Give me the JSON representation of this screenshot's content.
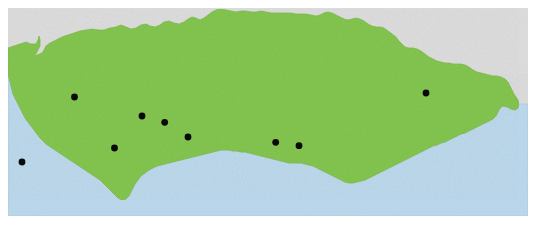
{
  "figure": {
    "kind": "reference-map",
    "width": 537,
    "height": 230
  },
  "colors": {
    "land": "#7DC242",
    "land_shade": "#76BA3E",
    "sea": "#B9D7EC",
    "neighbour_land": "#DCDCDC",
    "outline": "#9FBF7F",
    "sea_outline": "#A9C8DE",
    "point": "#0A0A0A",
    "page": "#FFFFFF"
  },
  "frame": {
    "left": 8,
    "top": 8,
    "right": 528,
    "bottom": 216
  },
  "legend": {
    "land_label": "Land",
    "sea_label": "Sea",
    "neighbour_label": "Adjacent territory",
    "point_label": "Record locality"
  },
  "map_data": {
    "type": "point-map",
    "region_name": "Andalusia",
    "point_radius": 3.4,
    "point_count": 9,
    "points": [
      {
        "id": "p1",
        "x": 22,
        "y": 162,
        "label": ""
      },
      {
        "id": "p2",
        "x": 74.5,
        "y": 97,
        "label": ""
      },
      {
        "id": "p3",
        "x": 114.5,
        "y": 148,
        "label": ""
      },
      {
        "id": "p4",
        "x": 142,
        "y": 116,
        "label": ""
      },
      {
        "id": "p5",
        "x": 164.7,
        "y": 122.3,
        "label": ""
      },
      {
        "id": "p6",
        "x": 188,
        "y": 137,
        "label": ""
      },
      {
        "id": "p7",
        "x": 275.7,
        "y": 142.3,
        "label": ""
      },
      {
        "id": "p8",
        "x": 299,
        "y": 145.7,
        "label": ""
      },
      {
        "id": "p9",
        "x": 426,
        "y": 93,
        "label": ""
      }
    ],
    "land_outline": [
      [
        8,
        48
      ],
      [
        14,
        46
      ],
      [
        20,
        44
      ],
      [
        26,
        42
      ],
      [
        31,
        44
      ],
      [
        36,
        44
      ],
      [
        38,
        40
      ],
      [
        39,
        36
      ],
      [
        40,
        40
      ],
      [
        40,
        46
      ],
      [
        38,
        50
      ],
      [
        36,
        54
      ],
      [
        33,
        56
      ],
      [
        37,
        55
      ],
      [
        42,
        53
      ],
      [
        44,
        50
      ],
      [
        46,
        46
      ],
      [
        50,
        43
      ],
      [
        56,
        40
      ],
      [
        62,
        37
      ],
      [
        68,
        35
      ],
      [
        74,
        33
      ],
      [
        80,
        31
      ],
      [
        86,
        30
      ],
      [
        92,
        29
      ],
      [
        98,
        30
      ],
      [
        104,
        30
      ],
      [
        110,
        28
      ],
      [
        116,
        27
      ],
      [
        121,
        25
      ],
      [
        126,
        27
      ],
      [
        131,
        29
      ],
      [
        136,
        28
      ],
      [
        141,
        25
      ],
      [
        146,
        24
      ],
      [
        150,
        26
      ],
      [
        155,
        27
      ],
      [
        160,
        25
      ],
      [
        164,
        22
      ],
      [
        169,
        21
      ],
      [
        174,
        23
      ],
      [
        179,
        24
      ],
      [
        184,
        22
      ],
      [
        188,
        19
      ],
      [
        192,
        17
      ],
      [
        196,
        18
      ],
      [
        200,
        20
      ],
      [
        204,
        18
      ],
      [
        208,
        15
      ],
      [
        212,
        12
      ],
      [
        216,
        10
      ],
      [
        221,
        9
      ],
      [
        226,
        10
      ],
      [
        231,
        11
      ],
      [
        236,
        12
      ],
      [
        241,
        11
      ],
      [
        246,
        11
      ],
      [
        251,
        12
      ],
      [
        256,
        12
      ],
      [
        261,
        11
      ],
      [
        266,
        12
      ],
      [
        271,
        13
      ],
      [
        276,
        13
      ],
      [
        281,
        13
      ],
      [
        286,
        13
      ],
      [
        291,
        13
      ],
      [
        296,
        14
      ],
      [
        301,
        14
      ],
      [
        306,
        14
      ],
      [
        311,
        15
      ],
      [
        316,
        16
      ],
      [
        320,
        15
      ],
      [
        324,
        13
      ],
      [
        328,
        12
      ],
      [
        332,
        13
      ],
      [
        336,
        15
      ],
      [
        340,
        17
      ],
      [
        344,
        19
      ],
      [
        348,
        20
      ],
      [
        352,
        19
      ],
      [
        356,
        18
      ],
      [
        360,
        19
      ],
      [
        364,
        21
      ],
      [
        368,
        24
      ],
      [
        372,
        26
      ],
      [
        376,
        27
      ],
      [
        380,
        27
      ],
      [
        384,
        28
      ],
      [
        388,
        31
      ],
      [
        392,
        34
      ],
      [
        396,
        37
      ],
      [
        399,
        41
      ],
      [
        402,
        44
      ],
      [
        405,
        47
      ],
      [
        409,
        48
      ],
      [
        413,
        48
      ],
      [
        417,
        49
      ],
      [
        421,
        51
      ],
      [
        425,
        54
      ],
      [
        429,
        57
      ],
      [
        433,
        59
      ],
      [
        437,
        61
      ],
      [
        441,
        62
      ],
      [
        445,
        63
      ],
      [
        449,
        63
      ],
      [
        453,
        64
      ],
      [
        457,
        64
      ],
      [
        461,
        64
      ],
      [
        465,
        65
      ],
      [
        469,
        67
      ],
      [
        473,
        70
      ],
      [
        477,
        72
      ],
      [
        481,
        73
      ],
      [
        485,
        74
      ],
      [
        489,
        75
      ],
      [
        493,
        76
      ],
      [
        497,
        76
      ],
      [
        501,
        77
      ],
      [
        505,
        79
      ],
      [
        508,
        82
      ],
      [
        510,
        86
      ],
      [
        512,
        90
      ],
      [
        514,
        94
      ],
      [
        516,
        97
      ],
      [
        518,
        100
      ],
      [
        519,
        104
      ],
      [
        518,
        108
      ],
      [
        515,
        110
      ],
      [
        511,
        109
      ],
      [
        507,
        107
      ],
      [
        503,
        106
      ],
      [
        500,
        108
      ],
      [
        498,
        112
      ],
      [
        496,
        116
      ],
      [
        493,
        119
      ],
      [
        489,
        121
      ],
      [
        485,
        123
      ],
      [
        481,
        125
      ],
      [
        477,
        127
      ],
      [
        473,
        129
      ],
      [
        469,
        131
      ],
      [
        465,
        133
      ],
      [
        461,
        134
      ],
      [
        457,
        136
      ],
      [
        453,
        138
      ],
      [
        449,
        140
      ],
      [
        445,
        142
      ],
      [
        441,
        143
      ],
      [
        437,
        145
      ],
      [
        433,
        146
      ],
      [
        429,
        148
      ],
      [
        425,
        150
      ],
      [
        421,
        152
      ],
      [
        417,
        154
      ],
      [
        413,
        156
      ],
      [
        409,
        158
      ],
      [
        405,
        160
      ],
      [
        401,
        162
      ],
      [
        397,
        164
      ],
      [
        393,
        166
      ],
      [
        389,
        168
      ],
      [
        385,
        170
      ],
      [
        381,
        172
      ],
      [
        377,
        174
      ],
      [
        373,
        176
      ],
      [
        369,
        178
      ],
      [
        365,
        180
      ],
      [
        361,
        181
      ],
      [
        357,
        182
      ],
      [
        353,
        183
      ],
      [
        349,
        183
      ],
      [
        345,
        182
      ],
      [
        341,
        180
      ],
      [
        337,
        178
      ],
      [
        333,
        176
      ],
      [
        329,
        174
      ],
      [
        325,
        172
      ],
      [
        321,
        170
      ],
      [
        317,
        168
      ],
      [
        313,
        166
      ],
      [
        309,
        165
      ],
      [
        305,
        164
      ],
      [
        301,
        163
      ],
      [
        297,
        163
      ],
      [
        293,
        163
      ],
      [
        289,
        163
      ],
      [
        285,
        162
      ],
      [
        281,
        161
      ],
      [
        277,
        160
      ],
      [
        273,
        159
      ],
      [
        269,
        158
      ],
      [
        265,
        157
      ],
      [
        261,
        156
      ],
      [
        257,
        155
      ],
      [
        253,
        154
      ],
      [
        249,
        153
      ],
      [
        245,
        152
      ],
      [
        241,
        152
      ],
      [
        237,
        151
      ],
      [
        233,
        151
      ],
      [
        229,
        150
      ],
      [
        225,
        150
      ],
      [
        221,
        150
      ],
      [
        217,
        151
      ],
      [
        213,
        152
      ],
      [
        209,
        153
      ],
      [
        205,
        154
      ],
      [
        201,
        155
      ],
      [
        197,
        156
      ],
      [
        193,
        157
      ],
      [
        189,
        158
      ],
      [
        185,
        159
      ],
      [
        181,
        160
      ],
      [
        177,
        161
      ],
      [
        173,
        162
      ],
      [
        169,
        163
      ],
      [
        165,
        164
      ],
      [
        161,
        165
      ],
      [
        157,
        166
      ],
      [
        153,
        168
      ],
      [
        149,
        170
      ],
      [
        145,
        173
      ],
      [
        141,
        176
      ],
      [
        138,
        180
      ],
      [
        135,
        184
      ],
      [
        133,
        188
      ],
      [
        131,
        192
      ],
      [
        129,
        196
      ],
      [
        126,
        199
      ],
      [
        122,
        200
      ],
      [
        118,
        198
      ],
      [
        115,
        195
      ],
      [
        112,
        192
      ],
      [
        109,
        189
      ],
      [
        106,
        186
      ],
      [
        103,
        183
      ],
      [
        100,
        180
      ],
      [
        97,
        178
      ],
      [
        94,
        176
      ],
      [
        91,
        174
      ],
      [
        88,
        172
      ],
      [
        85,
        170
      ],
      [
        82,
        168
      ],
      [
        79,
        166
      ],
      [
        76,
        164
      ],
      [
        73,
        162
      ],
      [
        70,
        160
      ],
      [
        67,
        158
      ],
      [
        64,
        156
      ],
      [
        61,
        154
      ],
      [
        58,
        152
      ],
      [
        55,
        150
      ],
      [
        52,
        148
      ],
      [
        49,
        146
      ],
      [
        46,
        144
      ],
      [
        43,
        141
      ],
      [
        40,
        138
      ],
      [
        37,
        134
      ],
      [
        34,
        130
      ],
      [
        31,
        126
      ],
      [
        28,
        122
      ],
      [
        25,
        118
      ],
      [
        23,
        114
      ],
      [
        21,
        110
      ],
      [
        19,
        106
      ],
      [
        17,
        102
      ],
      [
        15,
        98
      ],
      [
        13,
        94
      ],
      [
        12,
        90
      ],
      [
        11,
        86
      ],
      [
        10,
        82
      ],
      [
        9,
        78
      ],
      [
        8,
        74
      ],
      [
        8,
        66
      ],
      [
        8,
        58
      ]
    ],
    "sea_outline": [
      [
        8,
        216
      ],
      [
        528,
        216
      ],
      [
        528,
        104
      ],
      [
        519,
        104
      ],
      [
        518,
        108
      ],
      [
        515,
        110
      ],
      [
        511,
        109
      ],
      [
        507,
        107
      ],
      [
        503,
        106
      ],
      [
        500,
        108
      ],
      [
        498,
        112
      ],
      [
        496,
        116
      ],
      [
        493,
        119
      ],
      [
        489,
        121
      ],
      [
        485,
        123
      ],
      [
        481,
        125
      ],
      [
        477,
        127
      ],
      [
        473,
        129
      ],
      [
        469,
        131
      ],
      [
        465,
        133
      ],
      [
        461,
        134
      ],
      [
        457,
        136
      ],
      [
        453,
        138
      ],
      [
        449,
        140
      ],
      [
        445,
        142
      ],
      [
        441,
        143
      ],
      [
        437,
        145
      ],
      [
        433,
        146
      ],
      [
        429,
        148
      ],
      [
        425,
        150
      ],
      [
        421,
        152
      ],
      [
        417,
        154
      ],
      [
        413,
        156
      ],
      [
        409,
        158
      ],
      [
        405,
        160
      ],
      [
        401,
        162
      ],
      [
        397,
        164
      ],
      [
        393,
        166
      ],
      [
        389,
        168
      ],
      [
        385,
        170
      ],
      [
        381,
        172
      ],
      [
        377,
        174
      ],
      [
        373,
        176
      ],
      [
        369,
        178
      ],
      [
        365,
        180
      ],
      [
        361,
        181
      ],
      [
        357,
        182
      ],
      [
        353,
        183
      ],
      [
        349,
        183
      ],
      [
        345,
        182
      ],
      [
        341,
        180
      ],
      [
        337,
        178
      ],
      [
        333,
        176
      ],
      [
        329,
        174
      ],
      [
        325,
        172
      ],
      [
        321,
        170
      ],
      [
        317,
        168
      ],
      [
        313,
        166
      ],
      [
        309,
        165
      ],
      [
        305,
        164
      ],
      [
        301,
        163
      ],
      [
        297,
        163
      ],
      [
        293,
        163
      ],
      [
        289,
        163
      ],
      [
        285,
        162
      ],
      [
        281,
        161
      ],
      [
        277,
        160
      ],
      [
        273,
        159
      ],
      [
        269,
        158
      ],
      [
        265,
        157
      ],
      [
        261,
        156
      ],
      [
        257,
        155
      ],
      [
        253,
        154
      ],
      [
        249,
        153
      ],
      [
        245,
        152
      ],
      [
        241,
        152
      ],
      [
        237,
        151
      ],
      [
        233,
        151
      ],
      [
        229,
        150
      ],
      [
        225,
        150
      ],
      [
        221,
        150
      ],
      [
        217,
        151
      ],
      [
        213,
        152
      ],
      [
        209,
        153
      ],
      [
        205,
        154
      ],
      [
        201,
        155
      ],
      [
        197,
        156
      ],
      [
        193,
        157
      ],
      [
        189,
        158
      ],
      [
        185,
        159
      ],
      [
        181,
        160
      ],
      [
        177,
        161
      ],
      [
        173,
        162
      ],
      [
        169,
        163
      ],
      [
        165,
        164
      ],
      [
        161,
        165
      ],
      [
        157,
        166
      ],
      [
        153,
        168
      ],
      [
        149,
        170
      ],
      [
        145,
        173
      ],
      [
        141,
        176
      ],
      [
        138,
        180
      ],
      [
        135,
        184
      ],
      [
        133,
        188
      ],
      [
        131,
        192
      ],
      [
        129,
        196
      ],
      [
        126,
        199
      ],
      [
        122,
        200
      ],
      [
        118,
        198
      ],
      [
        115,
        195
      ],
      [
        112,
        192
      ],
      [
        109,
        189
      ],
      [
        106,
        186
      ],
      [
        103,
        183
      ],
      [
        100,
        180
      ],
      [
        97,
        178
      ],
      [
        94,
        176
      ],
      [
        91,
        174
      ],
      [
        88,
        172
      ],
      [
        85,
        170
      ],
      [
        82,
        168
      ],
      [
        79,
        166
      ],
      [
        76,
        164
      ],
      [
        73,
        162
      ],
      [
        70,
        160
      ],
      [
        67,
        158
      ],
      [
        64,
        156
      ],
      [
        61,
        154
      ],
      [
        58,
        152
      ],
      [
        55,
        150
      ],
      [
        52,
        148
      ],
      [
        49,
        146
      ],
      [
        46,
        144
      ],
      [
        43,
        141
      ],
      [
        40,
        138
      ],
      [
        37,
        134
      ],
      [
        34,
        130
      ],
      [
        31,
        126
      ],
      [
        28,
        122
      ],
      [
        25,
        118
      ],
      [
        23,
        114
      ],
      [
        21,
        110
      ],
      [
        19,
        106
      ],
      [
        17,
        102
      ],
      [
        15,
        98
      ],
      [
        13,
        94
      ],
      [
        12,
        90
      ],
      [
        11,
        86
      ],
      [
        10,
        82
      ],
      [
        9,
        78
      ],
      [
        8,
        74
      ]
    ]
  }
}
